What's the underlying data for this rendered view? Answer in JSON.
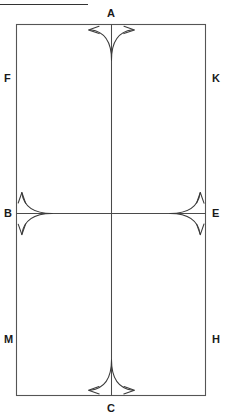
{
  "figure": {
    "type": "line-diagram",
    "title_rule": {
      "name": "top-horizontal-rule",
      "x1": 0,
      "y1": 4,
      "x2": 88,
      "y2": 4,
      "color": "#333333",
      "stroke_width": 1.2
    },
    "colors": {
      "stroke": "#4a4a4a",
      "rect_stroke": "#555555",
      "arrow_stroke": "#3a3a3a",
      "label_text": "#1a1a1a",
      "background": "#ffffff"
    },
    "rectangle": {
      "name": "outer-rectangle",
      "x": 16,
      "y": 24,
      "width": 190,
      "height": 372,
      "stroke_width": 1.1
    },
    "center_lines": {
      "vertical": {
        "name": "vertical-centerline",
        "x": 111,
        "y1": 24,
        "y2": 396
      },
      "horizontal": {
        "name": "horizontal-midline",
        "y": 213,
        "x1": 16,
        "x2": 206
      }
    },
    "arrow_glyphs": [
      {
        "id": "arrow-top",
        "name": "bifurcating-arrow-top",
        "anchor_label": "A",
        "orientation": "up",
        "apex_x": 111,
        "apex_y": 52,
        "tip_left_x": 88,
        "tip_left_y": 30,
        "tip_right_x": 134,
        "tip_right_y": 30
      },
      {
        "id": "arrow-bottom",
        "name": "bifurcating-arrow-bottom",
        "anchor_label": "C",
        "orientation": "down",
        "apex_x": 111,
        "apex_y": 369,
        "tip_left_x": 88,
        "tip_left_y": 391,
        "tip_right_x": 134,
        "tip_right_y": 391
      },
      {
        "id": "arrow-left",
        "name": "bifurcating-arrow-left",
        "anchor_label": "B",
        "orientation": "left",
        "apex_x": 43,
        "apex_y": 213,
        "tip_up_x": 21,
        "tip_up_y": 191,
        "tip_down_x": 21,
        "tip_down_y": 235
      },
      {
        "id": "arrow-right",
        "name": "bifurcating-arrow-right",
        "anchor_label": "E",
        "orientation": "right",
        "apex_x": 179,
        "apex_y": 213,
        "tip_up_x": 201,
        "tip_up_y": 191,
        "tip_down_x": 201,
        "tip_down_y": 235
      }
    ]
  },
  "labels": {
    "A": "A",
    "B": "B",
    "C": "C",
    "E": "E",
    "F": "F",
    "H": "H",
    "K": "K",
    "M": "M"
  }
}
